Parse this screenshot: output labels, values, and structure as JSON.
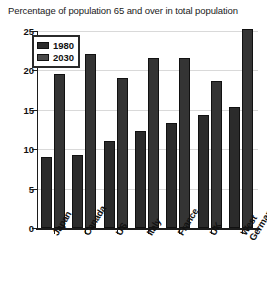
{
  "chart_data": {
    "type": "bar",
    "title": "Percentage of population 65 and over in total population",
    "xlabel": "",
    "ylabel": "",
    "ylim": [
      0,
      25
    ],
    "yticks": [
      "0",
      "5",
      "10",
      "15",
      "20",
      "25"
    ],
    "ytick_values": [
      0,
      5,
      10,
      15,
      20,
      25
    ],
    "grid": true,
    "legend_position": "upper-left-inside",
    "categories": [
      "Japan",
      "Canada",
      "US",
      "Italy",
      "France",
      "UK",
      "West Germany"
    ],
    "series": [
      {
        "name": "1980",
        "color": "#2b2b2b",
        "values": [
          9.0,
          9.3,
          11.0,
          12.3,
          13.3,
          14.4,
          15.3
        ]
      },
      {
        "name": "2030",
        "color": "#343434",
        "values": [
          19.5,
          22.1,
          19.0,
          21.6,
          21.6,
          18.6,
          25.2
        ]
      }
    ]
  },
  "legend": {
    "items": [
      {
        "label": "1980"
      },
      {
        "label": "2030"
      }
    ]
  }
}
